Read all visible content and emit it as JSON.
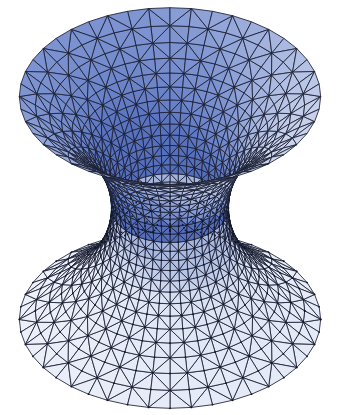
{
  "figure": {
    "title": "Catenoid minimal surface triangulated mesh",
    "kind": "3d-surface-render",
    "background_color": "#ffffff",
    "canvas": {
      "width": 341,
      "height": 415
    }
  },
  "chart_data": {
    "type": "surface",
    "title": "Catenoid minimal surface triangulated mesh",
    "subtitle": "",
    "xlabel": "",
    "ylabel": "",
    "surface_name": "catenoid",
    "parametric_equations": {
      "x": "c * cosh(v / c) * cos(u)",
      "y": "c * cosh(v / c) * sin(u)",
      "z": "v"
    },
    "parameters": {
      "c": 1.0,
      "u_range": [
        0,
        6.283185307179586
      ],
      "v_range": [
        -1.6,
        1.6
      ],
      "u_segments": 44,
      "v_segments": 26
    },
    "mesh": {
      "tessellation": "quads split into triangles",
      "diagonal_direction": "both",
      "edge_color": "#1a1f33",
      "edge_width": 0.85,
      "vertex_dots": true,
      "vertex_dot_color": "#12162b"
    },
    "shading": {
      "model": "lambert-diffuse",
      "light_direction": [
        -0.35,
        -0.55,
        0.76
      ],
      "ambient": 0.34,
      "top_surface_color_dark": "#5a74c0",
      "top_surface_color_mid": "#7f95d2",
      "top_surface_color_light": "#ccd5ec",
      "bottom_surface_color_dark": "#9badd8",
      "bottom_surface_color_light": "#dce4f4",
      "rim_strip_color": "#e8ecf7",
      "darkest_blue": "#4a63b4",
      "lightest_blue": "#eef1f9"
    },
    "camera": {
      "projection": "orthographic",
      "elevation_deg": 18,
      "azimuth_deg": 0,
      "scale_x": 152,
      "scale_y": 152,
      "center_x": 170,
      "center_y": 208
    },
    "measured_extents": {
      "top_y": 13,
      "bottom_y": 403,
      "upper_bowl_left_x": 17,
      "upper_bowl_right_x": 315,
      "lower_bowl_left_x": 12,
      "lower_bowl_right_x": 325,
      "waist_left_x": 130,
      "waist_right_x": 215,
      "waist_center_y": 215
    },
    "grid": false,
    "legend": null,
    "axes_visible": false
  }
}
